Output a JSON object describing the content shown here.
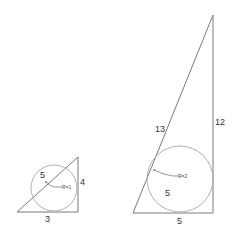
{
  "small_triangle": {
    "hypotenuse_label": "5",
    "vertical_label": "4",
    "base_label": "3",
    "radius_label": "R=1"
  },
  "large_triangle": {
    "hypotenuse_label": "13",
    "vertical_label": "12",
    "base_label": "5",
    "radius_label": "R=2",
    "inner_label": "5"
  },
  "colors": {
    "edge": "#7a7a7a",
    "circle": "#b0b0b0",
    "text": "#333333"
  }
}
